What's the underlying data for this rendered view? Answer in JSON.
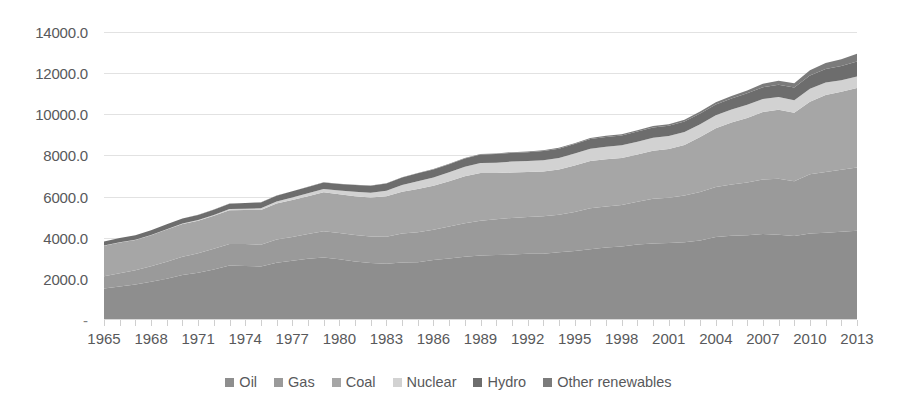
{
  "chart_data": {
    "type": "area",
    "stacked": true,
    "title": "",
    "xlabel": "",
    "ylabel": "",
    "grid": true,
    "legend_position": "bottom",
    "ylim": [
      0,
      14000
    ],
    "yticks": [
      0,
      2000,
      4000,
      6000,
      8000,
      10000,
      12000,
      14000
    ],
    "ytick_labels": [
      "-",
      "2000.0",
      "4000.0",
      "6000.0",
      "8000.0",
      "10000.0",
      "12000.0",
      "14000.0"
    ],
    "xlim": [
      1965,
      2013
    ],
    "xticks_labeled": [
      "1965",
      "1968",
      "1971",
      "1974",
      "1977",
      "1980",
      "1983",
      "1986",
      "1989",
      "1992",
      "1995",
      "1998",
      "2001",
      "2004",
      "2007",
      "2010",
      "2013"
    ],
    "x": [
      1965,
      1966,
      1967,
      1968,
      1969,
      1970,
      1971,
      1972,
      1973,
      1974,
      1975,
      1976,
      1977,
      1978,
      1979,
      1980,
      1981,
      1982,
      1983,
      1984,
      1985,
      1986,
      1987,
      1988,
      1989,
      1990,
      1991,
      1992,
      1993,
      1994,
      1995,
      1996,
      1997,
      1998,
      1999,
      2000,
      2001,
      2002,
      2003,
      2004,
      2005,
      2006,
      2007,
      2008,
      2009,
      2010,
      2011,
      2012,
      2013
    ],
    "series": [
      {
        "name": "Oil",
        "color": "#8e8e8e",
        "values": [
          1530,
          1630,
          1730,
          1860,
          2010,
          2190,
          2300,
          2460,
          2650,
          2630,
          2600,
          2780,
          2880,
          2980,
          3040,
          2950,
          2840,
          2770,
          2740,
          2800,
          2810,
          2920,
          2990,
          3080,
          3140,
          3160,
          3180,
          3220,
          3220,
          3290,
          3350,
          3440,
          3530,
          3570,
          3670,
          3720,
          3740,
          3780,
          3870,
          4030,
          4090,
          4120,
          4180,
          4150,
          4080,
          4200,
          4240,
          4290,
          4340
        ]
      },
      {
        "name": "Gas",
        "color": "#9a9a9a",
        "values": [
          600,
          640,
          690,
          750,
          820,
          880,
          940,
          1000,
          1040,
          1060,
          1060,
          1130,
          1150,
          1200,
          1270,
          1280,
          1290,
          1290,
          1310,
          1400,
          1450,
          1470,
          1550,
          1620,
          1690,
          1740,
          1780,
          1790,
          1820,
          1830,
          1900,
          1990,
          1990,
          2020,
          2080,
          2180,
          2200,
          2270,
          2350,
          2430,
          2500,
          2560,
          2650,
          2720,
          2660,
          2880,
          2950,
          3010,
          3070
        ]
      },
      {
        "name": "Coal",
        "color": "#a6a6a6",
        "values": [
          1480,
          1500,
          1470,
          1510,
          1570,
          1600,
          1590,
          1610,
          1650,
          1660,
          1690,
          1750,
          1800,
          1830,
          1900,
          1880,
          1880,
          1890,
          1960,
          2030,
          2110,
          2140,
          2210,
          2290,
          2320,
          2240,
          2210,
          2180,
          2180,
          2200,
          2260,
          2300,
          2300,
          2290,
          2290,
          2330,
          2370,
          2460,
          2680,
          2860,
          3010,
          3140,
          3280,
          3350,
          3330,
          3530,
          3750,
          3800,
          3870
        ]
      },
      {
        "name": "Nuclear",
        "color": "#d2d2d2",
        "values": [
          6,
          8,
          10,
          13,
          17,
          20,
          30,
          40,
          50,
          60,
          80,
          100,
          130,
          150,
          160,
          180,
          220,
          240,
          270,
          330,
          380,
          400,
          430,
          460,
          480,
          510,
          530,
          540,
          550,
          560,
          580,
          600,
          600,
          610,
          630,
          630,
          630,
          630,
          620,
          630,
          630,
          640,
          630,
          620,
          610,
          630,
          600,
          560,
          560
        ]
      },
      {
        "name": "Hydro",
        "color": "#6d6d6d",
        "values": [
          200,
          210,
          215,
          225,
          235,
          245,
          250,
          255,
          265,
          275,
          285,
          285,
          295,
          310,
          320,
          325,
          335,
          340,
          360,
          370,
          380,
          390,
          395,
          405,
          410,
          420,
          425,
          430,
          445,
          450,
          460,
          470,
          480,
          480,
          490,
          500,
          500,
          510,
          520,
          530,
          540,
          560,
          580,
          600,
          620,
          650,
          660,
          690,
          720
        ]
      },
      {
        "name": "Other renewables",
        "color": "#7b7b7b",
        "values": [
          1,
          1,
          1,
          2,
          2,
          2,
          3,
          3,
          4,
          4,
          5,
          5,
          6,
          7,
          8,
          9,
          10,
          11,
          12,
          14,
          16,
          18,
          20,
          23,
          26,
          29,
          32,
          35,
          38,
          42,
          46,
          50,
          55,
          60,
          66,
          73,
          80,
          88,
          98,
          110,
          124,
          140,
          160,
          185,
          210,
          245,
          290,
          330,
          380
        ]
      }
    ]
  },
  "legend": {
    "items": [
      {
        "label": "Oil",
        "color": "#8e8e8e"
      },
      {
        "label": "Gas",
        "color": "#9a9a9a"
      },
      {
        "label": "Coal",
        "color": "#a6a6a6"
      },
      {
        "label": "Nuclear",
        "color": "#d2d2d2"
      },
      {
        "label": "Hydro",
        "color": "#6d6d6d"
      },
      {
        "label": "Other renewables",
        "color": "#7b7b7b"
      }
    ]
  },
  "axes": {
    "y_labels": [
      "14000.0",
      "12000.0",
      "10000.0",
      "8000.0",
      "6000.0",
      "4000.0",
      "2000.0",
      "-"
    ],
    "x_labels": [
      "1965",
      "1968",
      "1971",
      "1974",
      "1977",
      "1980",
      "1983",
      "1986",
      "1989",
      "1992",
      "1995",
      "1998",
      "2001",
      "2004",
      "2007",
      "2010",
      "2013"
    ]
  }
}
